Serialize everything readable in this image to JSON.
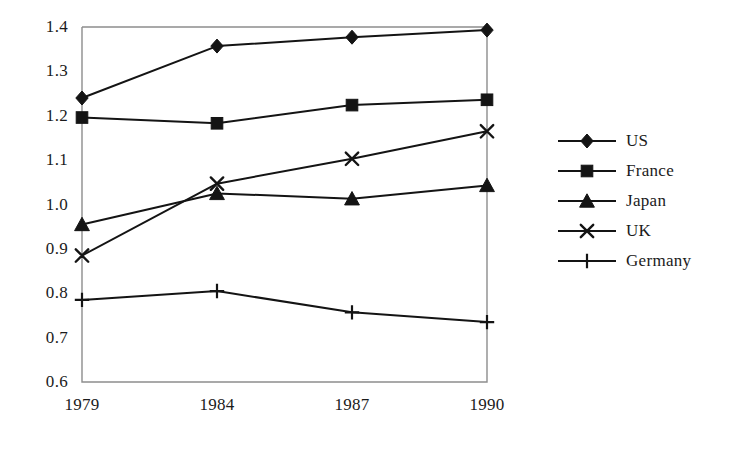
{
  "chart_data": {
    "type": "line",
    "title": "",
    "subtitle": "",
    "xlabel": "",
    "ylabel": "",
    "categories": [
      "1979",
      "1984",
      "1987",
      "1990"
    ],
    "x": [
      "1979",
      "1984",
      "1987",
      "1990"
    ],
    "ylim": [
      0.6,
      1.4
    ],
    "ytick_labels": [
      "1.4",
      "1.3",
      "1.2",
      "1.1",
      "1.0",
      "0.9",
      "0.8",
      "0.7",
      "0.6"
    ],
    "ytick_values": [
      1.4,
      1.3,
      1.2,
      1.1,
      1.0,
      0.9,
      0.8,
      0.7,
      0.6
    ],
    "grid": false,
    "legend_position": "right",
    "series": [
      {
        "name": "US",
        "marker": "diamond",
        "values": [
          1.24,
          1.357,
          1.377,
          1.393
        ]
      },
      {
        "name": "France",
        "marker": "square",
        "values": [
          1.196,
          1.183,
          1.224,
          1.236
        ]
      },
      {
        "name": "Japan",
        "marker": "triangle",
        "values": [
          0.955,
          1.025,
          1.013,
          1.043
        ]
      },
      {
        "name": "UK",
        "marker": "x",
        "values": [
          0.885,
          1.047,
          1.103,
          1.165
        ]
      },
      {
        "name": "Germany",
        "marker": "plus",
        "values": [
          0.785,
          0.805,
          0.757,
          0.735
        ]
      }
    ]
  },
  "legend": {
    "items": [
      {
        "label": "US"
      },
      {
        "label": "France"
      },
      {
        "label": "Japan"
      },
      {
        "label": "UK"
      },
      {
        "label": "Germany"
      }
    ]
  },
  "colors": {
    "series": "#141414",
    "axis": "#8d8d8d",
    "text": "#1b1b1b",
    "background": "#ffffff"
  }
}
